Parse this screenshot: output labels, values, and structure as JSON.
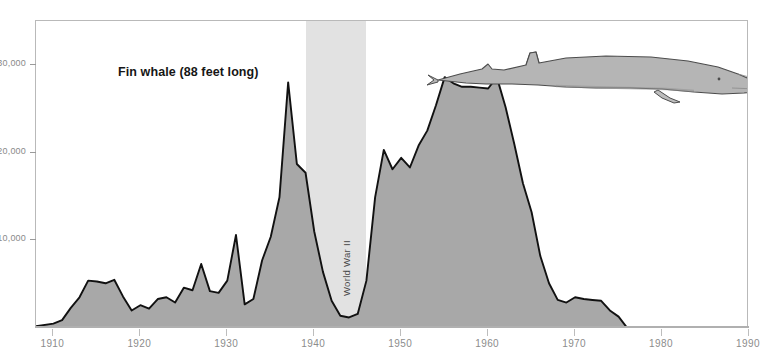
{
  "chart_data": {
    "type": "area",
    "title": "Fin whale (88 feet long)",
    "xlabel": "",
    "ylabel": "",
    "xlim": [
      1908,
      1990
    ],
    "ylim": [
      0,
      35000
    ],
    "grid": false,
    "legend": null,
    "y_ticks": [
      10000,
      20000,
      30000
    ],
    "y_tick_labels": [
      "10,000",
      "20,000",
      "30,000"
    ],
    "x_ticks": [
      1910,
      1920,
      1930,
      1940,
      1950,
      1960,
      1970,
      1980,
      1990
    ],
    "x_tick_labels": [
      "1910",
      "1920",
      "1930",
      "1940",
      "1950",
      "1960",
      "1970",
      "1980",
      "1990"
    ],
    "series_name": "Fin whale catch",
    "x": [
      1908,
      1910,
      1911,
      1912,
      1913,
      1914,
      1915,
      1916,
      1917,
      1918,
      1919,
      1920,
      1921,
      1922,
      1923,
      1924,
      1925,
      1926,
      1927,
      1928,
      1929,
      1930,
      1931,
      1932,
      1933,
      1934,
      1935,
      1936,
      1937,
      1938,
      1939,
      1940,
      1941,
      1942,
      1943,
      1944,
      1945,
      1946,
      1947,
      1948,
      1949,
      1950,
      1951,
      1952,
      1953,
      1954,
      1955,
      1956,
      1957,
      1958,
      1959,
      1960,
      1961,
      1962,
      1963,
      1964,
      1965,
      1966,
      1967,
      1968,
      1969,
      1970,
      1971,
      1972,
      1973,
      1974,
      1975,
      1976,
      1980,
      1990
    ],
    "values": [
      200,
      500,
      900,
      2300,
      3500,
      5400,
      5300,
      5100,
      5500,
      3600,
      2000,
      2600,
      2200,
      3300,
      3500,
      2900,
      4600,
      4300,
      7300,
      4200,
      4000,
      5400,
      10600,
      2700,
      3300,
      7700,
      10400,
      14900,
      28000,
      18700,
      17700,
      11000,
      6400,
      3100,
      1400,
      1200,
      1600,
      5400,
      14900,
      20300,
      18100,
      19400,
      18300,
      20800,
      22500,
      25400,
      28600,
      27900,
      27500,
      27500,
      27400,
      27300,
      28600,
      25200,
      21000,
      16500,
      13200,
      8200,
      5100,
      3200,
      2900,
      3500,
      3300,
      3200,
      3100,
      2000,
      1300,
      0,
      0,
      0
    ],
    "annotations": [
      {
        "label": "World War II",
        "type": "shaded-band",
        "start": 1939,
        "end": 1946
      }
    ],
    "illustration": "fin-whale-side-profile",
    "colors": {
      "area_fill": "#a8a8a8",
      "area_stroke": "#111111",
      "band_fill": "#e2e2e2",
      "frame": "#b9b9b9",
      "axis_text": "#8a8a8a",
      "title_text": "#161616",
      "whale_fill": "#b5b5b5",
      "whale_stroke": "#4d4d4d"
    }
  },
  "ww2_band": {
    "label": "World War II"
  }
}
